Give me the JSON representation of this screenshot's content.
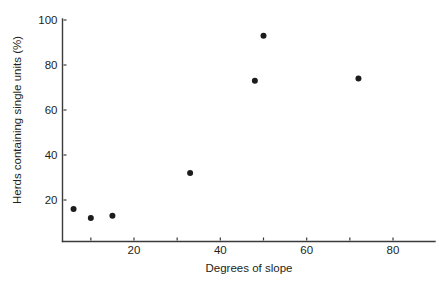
{
  "chart_data": {
    "type": "scatter",
    "title": "",
    "xlabel": "Degrees of slope",
    "ylabel": "Herds containing single units (%)",
    "xlim": [
      3,
      89
    ],
    "ylim": [
      0,
      100
    ],
    "grid": false,
    "legend": null,
    "x_ticks": [
      {
        "value": 10,
        "label": ""
      },
      {
        "value": 20,
        "label": "20"
      },
      {
        "value": 30,
        "label": ""
      },
      {
        "value": 40,
        "label": "40"
      },
      {
        "value": 50,
        "label": ""
      },
      {
        "value": 60,
        "label": "60"
      },
      {
        "value": 70,
        "label": ""
      },
      {
        "value": 80,
        "label": "80"
      }
    ],
    "y_ticks": [
      {
        "value": 20,
        "label": "20"
      },
      {
        "value": 40,
        "label": "40"
      },
      {
        "value": 60,
        "label": "60"
      },
      {
        "value": 80,
        "label": "80"
      },
      {
        "value": 100,
        "label": "100"
      }
    ],
    "x": [
      6,
      10,
      15,
      33,
      48,
      50,
      72
    ],
    "y": [
      16,
      12,
      13,
      32,
      73,
      93,
      74
    ],
    "points": [
      {
        "x": 6,
        "y": 16
      },
      {
        "x": 10,
        "y": 12
      },
      {
        "x": 15,
        "y": 13
      },
      {
        "x": 33,
        "y": 32
      },
      {
        "x": 48,
        "y": 73
      },
      {
        "x": 50,
        "y": 93
      },
      {
        "x": 72,
        "y": 74
      }
    ],
    "marker": {
      "shape": "circle",
      "color": "#1c1c1c",
      "size": 6
    },
    "axis_color": "#3b3b3b"
  }
}
